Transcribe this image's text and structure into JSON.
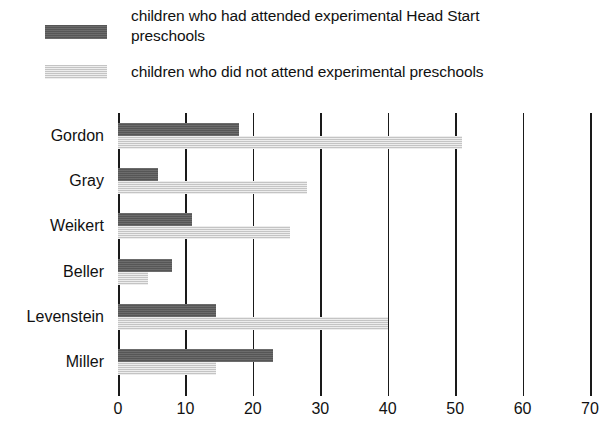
{
  "legend": {
    "items": [
      {
        "key": "attended",
        "label": "children who had attended experimental Head Start\npreschools",
        "color": "#5b5b5b"
      },
      {
        "key": "not_attended",
        "label": "children who did not attend experimental preschools",
        "color": "#d8d8d8"
      }
    ]
  },
  "chart_data": {
    "type": "bar",
    "orientation": "horizontal",
    "title": "",
    "xlabel": "",
    "ylabel": "",
    "xlim": [
      0,
      70
    ],
    "xticks": [
      0,
      10,
      20,
      30,
      40,
      50,
      60,
      70
    ],
    "xtick_labels": [
      "0",
      "10",
      "20",
      "30",
      "40",
      "50",
      "60",
      "70"
    ],
    "grid": true,
    "grid_axis": "x",
    "legend_position": "top-left",
    "categories": [
      "Gordon",
      "Gray",
      "Weikert",
      "Beller",
      "Levenstein",
      "Miller"
    ],
    "series": [
      {
        "name": "children who had attended experimental Head Start preschools",
        "color": "#5b5b5b",
        "values": [
          18,
          6,
          11,
          8,
          14.5,
          23
        ]
      },
      {
        "name": "children who did not attend experimental preschools",
        "color": "#d8d8d8",
        "values": [
          51,
          28,
          25.5,
          4.5,
          40,
          14.5
        ]
      }
    ]
  }
}
